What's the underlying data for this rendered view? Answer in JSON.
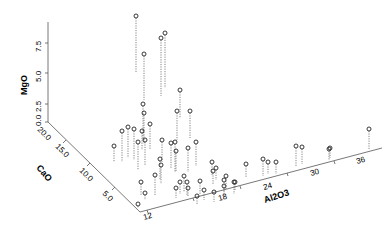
{
  "chart_data": {
    "type": "scatter3d",
    "title": "",
    "axes": {
      "x": {
        "label": "Al2O3",
        "ticks": [
          "12",
          "18",
          "24",
          "30",
          "36"
        ],
        "range": [
          9,
          39
        ]
      },
      "y": {
        "label": "CaO",
        "ticks": [
          "5.0",
          "10.0",
          "15.0",
          "20.0"
        ],
        "range": [
          0,
          20
        ]
      },
      "z": {
        "label": "MgO",
        "ticks": [
          "0.0",
          "2.5",
          "5.0",
          "7.5"
        ],
        "range": [
          0,
          8.5
        ]
      }
    },
    "grid": false,
    "legend": null,
    "drop_lines": true,
    "points_px": [
      {
        "x": 136,
        "y": 16,
        "base": 72
      },
      {
        "x": 144,
        "y": 54,
        "base": 100
      },
      {
        "x": 161,
        "y": 38,
        "base": 96
      },
      {
        "x": 165,
        "y": 33,
        "base": 88
      },
      {
        "x": 180,
        "y": 90,
        "base": 118
      },
      {
        "x": 177,
        "y": 111,
        "base": 140
      },
      {
        "x": 190,
        "y": 111,
        "base": 138
      },
      {
        "x": 143,
        "y": 104,
        "base": 140
      },
      {
        "x": 144,
        "y": 113,
        "base": 144
      },
      {
        "x": 150,
        "y": 124,
        "base": 150
      },
      {
        "x": 128,
        "y": 127,
        "base": 158
      },
      {
        "x": 134,
        "y": 129,
        "base": 160
      },
      {
        "x": 122,
        "y": 131,
        "base": 162
      },
      {
        "x": 142,
        "y": 131,
        "base": 150
      },
      {
        "x": 145,
        "y": 140,
        "base": 166
      },
      {
        "x": 138,
        "y": 142,
        "base": 170
      },
      {
        "x": 114,
        "y": 146,
        "base": 162
      },
      {
        "x": 162,
        "y": 140,
        "base": 162
      },
      {
        "x": 160,
        "y": 159,
        "base": 180
      },
      {
        "x": 171,
        "y": 143,
        "base": 168
      },
      {
        "x": 175,
        "y": 142,
        "base": 172
      },
      {
        "x": 176,
        "y": 151,
        "base": 172
      },
      {
        "x": 196,
        "y": 142,
        "base": 166
      },
      {
        "x": 188,
        "y": 148,
        "base": 172
      },
      {
        "x": 155,
        "y": 175,
        "base": 196
      },
      {
        "x": 161,
        "y": 165,
        "base": 184
      },
      {
        "x": 184,
        "y": 176,
        "base": 192
      },
      {
        "x": 180,
        "y": 182,
        "base": 194
      },
      {
        "x": 187,
        "y": 182,
        "base": 196
      },
      {
        "x": 200,
        "y": 181,
        "base": 194
      },
      {
        "x": 213,
        "y": 171,
        "base": 184
      },
      {
        "x": 212,
        "y": 162,
        "base": 176
      },
      {
        "x": 216,
        "y": 168,
        "base": 180
      },
      {
        "x": 226,
        "y": 176,
        "base": 190
      },
      {
        "x": 234,
        "y": 182,
        "base": 194
      },
      {
        "x": 235,
        "y": 182,
        "base": 190
      },
      {
        "x": 141,
        "y": 182,
        "base": 196
      },
      {
        "x": 138,
        "y": 204,
        "base": 208
      },
      {
        "x": 145,
        "y": 193,
        "base": 200
      },
      {
        "x": 176,
        "y": 188,
        "base": 198
      },
      {
        "x": 188,
        "y": 188,
        "base": 196
      },
      {
        "x": 204,
        "y": 190,
        "base": 200
      },
      {
        "x": 214,
        "y": 192,
        "base": 202
      },
      {
        "x": 197,
        "y": 196,
        "base": 204
      },
      {
        "x": 224,
        "y": 186,
        "base": 196
      },
      {
        "x": 224,
        "y": 180,
        "base": 192
      },
      {
        "x": 246,
        "y": 164,
        "base": 178
      },
      {
        "x": 263,
        "y": 159,
        "base": 176
      },
      {
        "x": 268,
        "y": 162,
        "base": 174
      },
      {
        "x": 276,
        "y": 162,
        "base": 174
      },
      {
        "x": 296,
        "y": 146,
        "base": 166
      },
      {
        "x": 302,
        "y": 147,
        "base": 164
      },
      {
        "x": 329,
        "y": 149,
        "base": 160
      },
      {
        "x": 330,
        "y": 148,
        "base": 158
      },
      {
        "x": 369,
        "y": 129,
        "base": 150
      }
    ]
  }
}
